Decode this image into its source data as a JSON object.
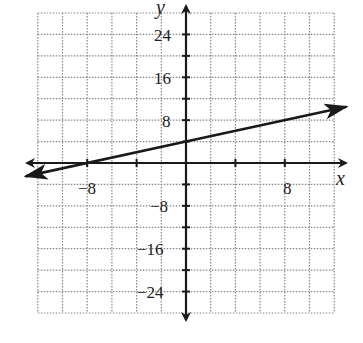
{
  "chart_data": {
    "type": "line",
    "title": "",
    "xlabel": "x",
    "ylabel": "y",
    "xlim": [
      -12,
      12
    ],
    "ylim": [
      -28,
      28
    ],
    "x_grid_step": 2,
    "y_grid_step": 4,
    "grid": true,
    "x_ticks_labeled": [
      -8,
      8
    ],
    "y_ticks_labeled": [
      24,
      16,
      8,
      -8,
      -16,
      -24
    ],
    "x_tick_marks": [
      -8,
      -4,
      4,
      8
    ],
    "y_tick_marks": [
      24,
      20,
      16,
      12,
      8,
      4,
      -4,
      -8,
      -12,
      -16,
      -20,
      -24
    ],
    "series": [
      {
        "name": "y = 0.5x + 4",
        "equation": "y = (1/2)x + 4",
        "slope": 0.5,
        "intercept": 4,
        "x": [
          -13,
          -8,
          0,
          8,
          13
        ],
        "y": [
          -2.5,
          0,
          4,
          8,
          10.5
        ],
        "arrows_both_ends": true
      }
    ],
    "colors": {
      "grid": "#888888",
      "axis": "#1a1a1a",
      "line": "#1a1a1a",
      "background": "#ffffff"
    }
  },
  "labels": {
    "x_axis": "x",
    "y_axis": "y",
    "x_neg8": "−8",
    "x_pos8": "8",
    "y_24": "24",
    "y_16": "16",
    "y_8": "8",
    "y_neg8": "−8",
    "y_neg16": "−16",
    "y_neg24": "−24"
  }
}
